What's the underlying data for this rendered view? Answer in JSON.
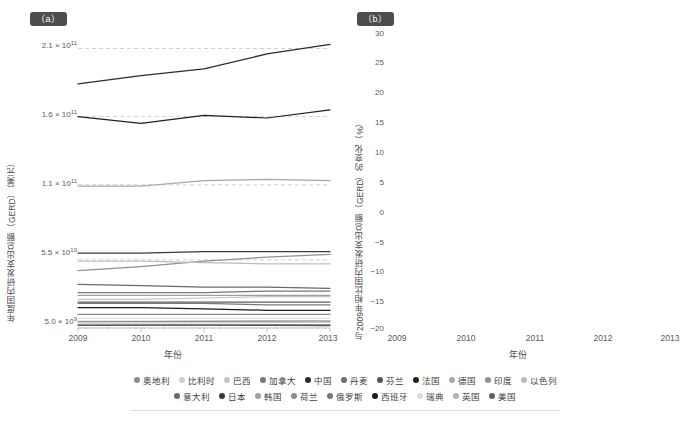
{
  "figure": {
    "panel_a_tag": "（a）",
    "panel_b_tag": "（b）"
  },
  "panel_a": {
    "ytitle": "年度国内研发支出总额（GERD）（美元）",
    "xtitle": "年份",
    "ytick_labels": [
      "2.1 × 10",
      "1.6 × 10",
      "1.1 × 10",
      "5.5 × 10",
      "5.0 × 10"
    ],
    "ytick_exponents": [
      "11",
      "11",
      "11",
      "10",
      "9"
    ],
    "xtick_labels": [
      "2009",
      "2010",
      "2011",
      "2012",
      "2013"
    ]
  },
  "panel_b": {
    "ytitle": "与2009年相比国内研发支出总额（GERD）的变化（%）",
    "xtitle": "年份",
    "ytick_labels": [
      "30",
      "25",
      "20",
      "15",
      "10",
      "5",
      "0",
      "−5",
      "−10",
      "−15",
      "−20"
    ],
    "xtick_labels": [
      "2009",
      "2010",
      "2011",
      "2012",
      "2013"
    ]
  },
  "legend": {
    "row1": [
      {
        "label": "奥地利",
        "color": "#8c8c8c"
      },
      {
        "label": "比利时",
        "color": "#cfcfcf"
      },
      {
        "label": "巴西",
        "color": "#c4c4c4"
      },
      {
        "label": "加拿大",
        "color": "#7a7a7a"
      },
      {
        "label": "中国",
        "color": "#2b2b2b"
      },
      {
        "label": "丹麦",
        "color": "#6e6e6e"
      },
      {
        "label": "芬兰",
        "color": "#555555"
      },
      {
        "label": "法国",
        "color": "#1f1f1f"
      },
      {
        "label": "德国",
        "color": "#a8a8a8"
      },
      {
        "label": "印度",
        "color": "#8f8f8f"
      },
      {
        "label": "以色列",
        "color": "#bdbdbd"
      }
    ],
    "row2": [
      {
        "label": "意大利",
        "color": "#6a6a6a"
      },
      {
        "label": "日本",
        "color": "#3a3a3a"
      },
      {
        "label": "韩国",
        "color": "#a0a0a0"
      },
      {
        "label": "荷兰",
        "color": "#8a8a8a"
      },
      {
        "label": "俄罗斯",
        "color": "#767676"
      },
      {
        "label": "西班牙",
        "color": "#1a1a1a"
      },
      {
        "label": "瑞典",
        "color": "#dcdcdc"
      },
      {
        "label": "英国",
        "color": "#b2b2b2"
      },
      {
        "label": "美国",
        "color": "#5e5e5e"
      }
    ]
  },
  "chart_data": [
    {
      "id": "panel-a",
      "type": "line",
      "title": "（a）",
      "xlabel": "年份",
      "ylabel": "年度国内研发支出总额（GERD）（美元）",
      "x": [
        2009,
        2010,
        2011,
        2012,
        2013
      ],
      "ylim": [
        5000000000.0,
        225000000000.0
      ],
      "yticks": [
        5000000000.0,
        55000000000.0,
        110000000000.0,
        160000000000.0,
        210000000000.0
      ],
      "ytick_text": [
        "5.0 × 10^9",
        "5.5 × 10^10",
        "1.1 × 10^11",
        "1.6 × 10^11",
        "2.1 × 10^11"
      ],
      "grid": true,
      "legend_position": "bottom",
      "series": [
        {
          "name": "美国",
          "color": "#2b2b2b",
          "values": [
            184000000000.0,
            190000000000.0,
            195000000000.0,
            206000000000.0,
            213000000000.0
          ]
        },
        {
          "name": "中国",
          "color": "#1f1f1f",
          "values": [
            160000000000.0,
            155000000000.0,
            161000000000.0,
            159000000000.0,
            165000000000.0
          ]
        },
        {
          "name": "日本",
          "color": "#a8a8a8",
          "values": [
            109000000000.0,
            109000000000.0,
            113000000000.0,
            114000000000.0,
            113000000000.0
          ]
        },
        {
          "name": "德国",
          "color": "#3a3a3a",
          "values": [
            60000000000.0,
            60000000000.0,
            61000000000.0,
            61000000000.0,
            61000000000.0
          ]
        },
        {
          "name": "韩国",
          "color": "#8f8f8f",
          "values": [
            47000000000.0,
            50000000000.0,
            54000000000.0,
            57000000000.0,
            59000000000.0
          ]
        },
        {
          "name": "法国",
          "color": "#bdbdbd",
          "values": [
            54000000000.0,
            54000000000.0,
            53000000000.0,
            52000000000.0,
            52000000000.0
          ]
        },
        {
          "name": "英国",
          "color": "#6a6a6a",
          "values": [
            37000000000.0,
            36000000000.0,
            35000000000.0,
            35000000000.0,
            34000000000.0
          ]
        },
        {
          "name": "俄罗斯",
          "color": "#767676",
          "values": [
            31000000000.0,
            31000000000.0,
            31000000000.0,
            32000000000.0,
            32000000000.0
          ]
        },
        {
          "name": "印度",
          "color": "#a0a0a0",
          "values": [
            29000000000.0,
            29000000000.0,
            29000000000.0,
            29000000000.0,
            29000000000.0
          ]
        },
        {
          "name": "巴西",
          "color": "#c4c4c4",
          "values": [
            26000000000.0,
            26000000000.0,
            27000000000.0,
            28000000000.0,
            28000000000.0
          ]
        },
        {
          "name": "意大利",
          "color": "#5e5e5e",
          "values": [
            24000000000.0,
            24000000000.0,
            24000000000.0,
            24000000000.0,
            24000000000.0
          ]
        },
        {
          "name": "加拿大",
          "color": "#7a7a7a",
          "values": [
            23000000000.0,
            23000000000.0,
            23000000000.0,
            22000000000.0,
            22000000000.0
          ]
        },
        {
          "name": "西班牙",
          "color": "#1a1a1a",
          "values": [
            20000000000.0,
            20000000000.0,
            19000000000.0,
            18000000000.0,
            18000000000.0
          ]
        },
        {
          "name": "荷兰",
          "color": "#8a8a8a",
          "values": [
            15000000000.0,
            15000000000.0,
            15000000000.0,
            15000000000.0,
            15000000000.0
          ]
        },
        {
          "name": "以色列",
          "color": "#cfcfcf",
          "values": [
            10000000000.0,
            10000000000.0,
            10000000000.0,
            10000000000.0,
            10000000000.0
          ]
        },
        {
          "name": "瑞典",
          "color": "#dcdcdc",
          "values": [
            12000000000.0,
            12000000000.0,
            12000000000.0,
            12000000000.0,
            12000000000.0
          ]
        },
        {
          "name": "奥地利",
          "color": "#8c8c8c",
          "values": [
            9500000000.0,
            9600000000.0,
            9800000000.0,
            10000000000.0,
            10000000000.0
          ]
        },
        {
          "name": "比利时",
          "color": "#cfcfcf",
          "values": [
            8500000000.0,
            8600000000.0,
            8800000000.0,
            9000000000.0,
            9100000000.0
          ]
        },
        {
          "name": "丹麦",
          "color": "#6e6e6e",
          "values": [
            7000000000.0,
            7100000000.0,
            7200000000.0,
            7300000000.0,
            7300000000.0
          ]
        },
        {
          "name": "芬兰",
          "color": "#555555",
          "values": [
            7200000000.0,
            7200000000.0,
            7100000000.0,
            6900000000.0,
            6800000000.0
          ]
        }
      ]
    },
    {
      "id": "panel-b",
      "type": "line",
      "title": "（b）",
      "xlabel": "年份",
      "ylabel": "与2009年相比国内研发支出总额（GERD）的变化（%）",
      "x": [
        2009,
        2010,
        2011,
        2012,
        2013
      ],
      "ylim": [
        -20,
        30
      ],
      "yticks": [
        -20,
        -15,
        -10,
        -5,
        0,
        5,
        10,
        15,
        20,
        25,
        30
      ],
      "grid": true,
      "legend_position": "bottom",
      "series": [
        {
          "name": "韩国",
          "color": "#a0a0a0",
          "values": [
            0,
            5.5,
            15.0,
            22.5,
            26.3
          ]
        },
        {
          "name": "中国",
          "color": "#1f1f1f",
          "values": [
            0,
            -0.3,
            7.5,
            16.8,
            21.2
          ]
        },
        {
          "name": "印度",
          "color": "#8f8f8f",
          "values": [
            0,
            5.0,
            12.0,
            16.8,
            17.8
          ]
        },
        {
          "name": "以色列",
          "color": "#bdbdbd",
          "values": [
            0,
            2.0,
            9.0,
            14.8,
            16.5
          ]
        },
        {
          "name": "丹麦",
          "color": "#6e6e6e",
          "values": [
            0,
            1.5,
            2.5,
            8.6,
            8.6
          ]
        },
        {
          "name": "比利时",
          "color": "#cfcfcf",
          "values": [
            0,
            1.0,
            2.0,
            6.5,
            5.7
          ]
        },
        {
          "name": "奥地利",
          "color": "#8c8c8c",
          "values": [
            0,
            6.0,
            3.8,
            4.2,
            3.2
          ]
        },
        {
          "name": "德国",
          "color": "#a8a8a8",
          "values": [
            0,
            0.5,
            3.5,
            4.0,
            2.3
          ]
        },
        {
          "name": "日本",
          "color": "#3a3a3a",
          "values": [
            0,
            -0.5,
            0.3,
            1.5,
            2.1
          ]
        },
        {
          "name": "美国",
          "color": "#5e5e5e",
          "values": [
            0,
            0.8,
            1.2,
            1.8,
            2.0
          ]
        },
        {
          "name": "瑞典",
          "color": "#dcdcdc",
          "values": [
            0,
            0.2,
            0.8,
            1.0,
            1.5
          ]
        },
        {
          "name": "巴西",
          "color": "#c4c4c4",
          "values": [
            0,
            0.5,
            -0.6,
            0.5,
            0.8
          ]
        },
        {
          "name": "加拿大",
          "color": "#7a7a7a",
          "values": [
            0,
            -1.2,
            -2.0,
            -2.8,
            -3.3
          ]
        },
        {
          "name": "荷兰",
          "color": "#8a8a8a",
          "values": [
            0,
            -2.5,
            -3.5,
            -5.5,
            -6.8
          ]
        },
        {
          "name": "法国",
          "color": "#bdbdbd",
          "values": [
            0,
            -1.8,
            -2.5,
            -3.0,
            -3.4
          ]
        },
        {
          "name": "俄罗斯",
          "color": "#767676",
          "values": [
            0,
            -1.0,
            -2.2,
            -6.2,
            -7.0
          ]
        },
        {
          "name": "英国",
          "color": "#b2b2b2",
          "values": [
            0,
            -3.0,
            -4.5,
            -7.0,
            -8.2
          ]
        },
        {
          "name": "意大利",
          "color": "#6a6a6a",
          "values": [
            0,
            -2.0,
            -3.2,
            -8.0,
            -10.6
          ]
        },
        {
          "name": "芬兰",
          "color": "#555555",
          "values": [
            0,
            -5.0,
            -6.0,
            -9.5,
            -10.8
          ]
        },
        {
          "name": "西班牙",
          "color": "#1a1a1a",
          "values": [
            0,
            -10.0,
            -12.8,
            -10.0,
            -14.6
          ]
        }
      ]
    }
  ]
}
